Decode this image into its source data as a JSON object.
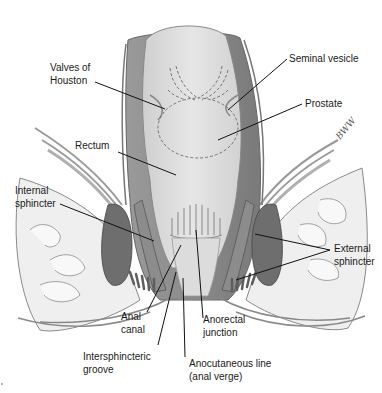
{
  "figure": {
    "colors": {
      "background": "#ffffff",
      "mucosa": "#d9d9d9",
      "mucosa_light": "#e8e8e8",
      "muscle_wall": "#8a8a8a",
      "muscle_dark": "#6e6e6e",
      "fat": "#efefef",
      "outline": "#777777",
      "leader": "#111111",
      "text": "#1a1a1a"
    },
    "signature": "BWW"
  },
  "labels": {
    "valves_of_houston": {
      "line1": "Valves of",
      "line2": "Houston"
    },
    "seminal_vesicle": {
      "line1": "Seminal vesicle"
    },
    "prostate": {
      "line1": "Prostate"
    },
    "rectum": {
      "line1": "Rectum"
    },
    "internal_sphincter": {
      "line1": "Internal",
      "line2": "sphincter"
    },
    "external_sphincter": {
      "line1": "External",
      "line2": "sphincter"
    },
    "anal_canal": {
      "line1": "Anal",
      "line2": "canal"
    },
    "anorectal_junction": {
      "line1": "Anorectal",
      "line2": "junction"
    },
    "intersphincteric_groove": {
      "line1": "Intersphincteric",
      "line2": "groove"
    },
    "anocutaneous_line": {
      "line1": "Anocutaneous line",
      "line2": "(anal verge)"
    }
  }
}
